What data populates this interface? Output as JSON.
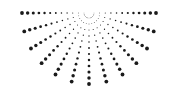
{
  "graphic": {
    "type": "radial-dot-burst",
    "description": "Half sunburst of dotted rays radiating downward from a top center point",
    "background": "#ffffff",
    "dot_color": "#1a1a1a",
    "center": {
      "x": 89,
      "y": 13
    },
    "ray_count": 13,
    "angle_start_deg": 0,
    "angle_end_deg": 180,
    "dots_per_ray": 12,
    "inner_radius": 5,
    "outer_radius_x": 67,
    "outer_radius_y": 71,
    "min_dot_radius": 0.35,
    "max_dot_radius": 1.9
  }
}
